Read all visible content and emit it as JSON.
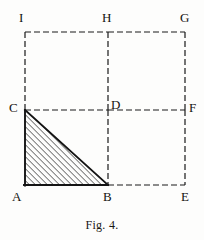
{
  "figure": {
    "caption": "Fig. 4.",
    "title": "Fig. 4.",
    "stroke_color": "#1a1a1a",
    "hatch_color": "#1a1a1a",
    "background_color": "#fdfdfc",
    "dash_pattern": "6,3",
    "line_width": 1.2,
    "solid_line_width": 1.8,
    "geometry": {
      "grid_columns": [
        25,
        108,
        185
      ],
      "grid_rows": [
        32,
        110,
        185
      ],
      "square_side_small": 75,
      "hatch_spacing": 3,
      "hatch_angle_degrees": 45
    },
    "points": [
      {
        "id": "I",
        "label": "I",
        "x": 25,
        "y": 32,
        "label_x": 19,
        "label_y": 11,
        "role": "corner-top-left"
      },
      {
        "id": "H",
        "label": "H",
        "x": 108,
        "y": 32,
        "label_x": 102,
        "label_y": 11,
        "role": "corner-top-mid"
      },
      {
        "id": "G",
        "label": "G",
        "x": 185,
        "y": 32,
        "label_x": 180,
        "label_y": 11,
        "role": "corner-top-right"
      },
      {
        "id": "C",
        "label": "C",
        "x": 25,
        "y": 110,
        "label_x": 9,
        "label_y": 101,
        "role": "triangle-apex"
      },
      {
        "id": "D",
        "label": "D",
        "x": 108,
        "y": 110,
        "label_x": 111,
        "label_y": 98,
        "role": "center"
      },
      {
        "id": "F",
        "label": "F",
        "x": 185,
        "y": 110,
        "label_x": 189,
        "label_y": 101,
        "role": "mid-right"
      },
      {
        "id": "A",
        "label": "A",
        "x": 25,
        "y": 185,
        "label_x": 12,
        "label_y": 190,
        "role": "triangle-right-angle"
      },
      {
        "id": "B",
        "label": "B",
        "x": 108,
        "y": 185,
        "label_x": 103,
        "label_y": 190,
        "role": "triangle-base-end"
      },
      {
        "id": "E",
        "label": "E",
        "x": 185,
        "y": 185,
        "label_x": 181,
        "label_y": 190,
        "role": "corner-bottom-right"
      }
    ],
    "solid_edges": [
      {
        "id": "A-C",
        "from": "A",
        "to": "C",
        "x1": 25,
        "y1": 185,
        "x2": 25,
        "y2": 110
      },
      {
        "id": "A-B",
        "from": "A",
        "to": "B",
        "x1": 25,
        "y1": 185,
        "x2": 108,
        "y2": 185
      },
      {
        "id": "C-B",
        "from": "C",
        "to": "B",
        "x1": 25,
        "y1": 110,
        "x2": 108,
        "y2": 185
      }
    ],
    "dashed_edges": [
      {
        "id": "I-H",
        "from": "I",
        "to": "H",
        "x1": 25,
        "y1": 32,
        "x2": 108,
        "y2": 32
      },
      {
        "id": "H-G",
        "from": "H",
        "to": "G",
        "x1": 108,
        "y1": 32,
        "x2": 185,
        "y2": 32
      },
      {
        "id": "I-C",
        "from": "I",
        "to": "C",
        "x1": 25,
        "y1": 32,
        "x2": 25,
        "y2": 110
      },
      {
        "id": "H-D",
        "from": "H",
        "to": "D",
        "x1": 108,
        "y1": 32,
        "x2": 108,
        "y2": 110
      },
      {
        "id": "G-F",
        "from": "G",
        "to": "F",
        "x1": 185,
        "y1": 32,
        "x2": 185,
        "y2": 110
      },
      {
        "id": "C-D",
        "from": "C",
        "to": "D",
        "x1": 25,
        "y1": 110,
        "x2": 108,
        "y2": 110
      },
      {
        "id": "D-F",
        "from": "D",
        "to": "F",
        "x1": 108,
        "y1": 110,
        "x2": 185,
        "y2": 110
      },
      {
        "id": "D-B",
        "from": "D",
        "to": "B",
        "x1": 108,
        "y1": 110,
        "x2": 108,
        "y2": 185
      },
      {
        "id": "F-E",
        "from": "F",
        "to": "E",
        "x1": 185,
        "y1": 110,
        "x2": 185,
        "y2": 185
      },
      {
        "id": "B-E",
        "from": "B",
        "to": "E",
        "x1": 108,
        "y1": 185,
        "x2": 185,
        "y2": 185
      }
    ],
    "hatched_region": {
      "id": "triangle-ABC",
      "vertices": "25,185 108,185 25,110",
      "description": "right triangle A B C with diagonal hatching"
    }
  }
}
